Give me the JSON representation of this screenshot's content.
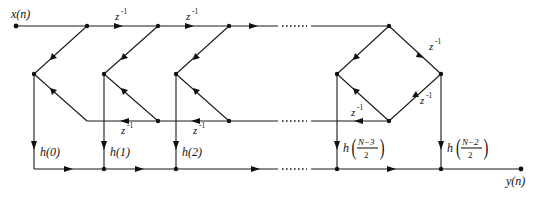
{
  "diagram": {
    "type": "signal-flow-graph",
    "colors": {
      "line": "#1a1a1a",
      "background": "#ffffff"
    },
    "input_label": "x(n)",
    "output_label": "y(n)",
    "delay_label": "z",
    "delay_exp": "-1",
    "ellipsis": "……",
    "coefficients": [
      {
        "id": "h0",
        "label": "h(0)"
      },
      {
        "id": "h1",
        "label": "h(1)"
      },
      {
        "id": "h2",
        "label": "h(2)"
      },
      {
        "id": "hN3",
        "prefix": "h",
        "num": "N−3",
        "den": "2"
      },
      {
        "id": "hN2",
        "prefix": "h",
        "num": "N−2",
        "den": "2"
      }
    ]
  }
}
